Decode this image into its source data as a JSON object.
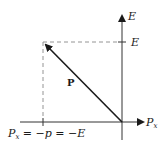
{
  "diagram": {
    "type": "momentum-energy vector diagram",
    "axes": {
      "vertical": {
        "label": "E",
        "tick_label": "E"
      },
      "horizontal": {
        "label": "P",
        "label_subscript": "x"
      }
    },
    "vector": {
      "label": "P"
    },
    "bottom_label": {
      "main": "P",
      "subscript": "x",
      "rest": " = −p = −E"
    },
    "colors": {
      "axis": "#333333",
      "dashed": "#888888",
      "vector": "#1a1a1a",
      "background": "#ffffff"
    }
  }
}
